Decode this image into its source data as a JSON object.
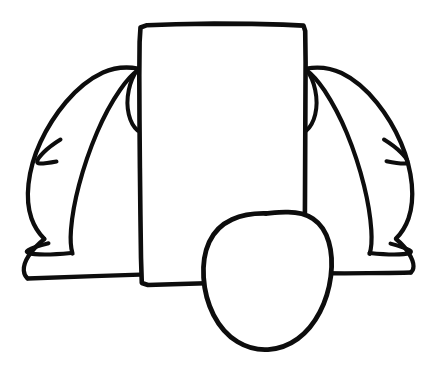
{
  "image": {
    "kind": "hand-drawn-line-art",
    "title": "Hand-drawn line sketch",
    "description": "Black ink outline drawing of a figure: a large upright rectangle forming the body, long draped hair or cape shapes sweeping outward to the left and right with pointed tips, and a rounded oval head overlapping the lower center of the rectangle.",
    "canvas": {
      "width": 432,
      "height": 366
    },
    "colors": {
      "background": "#ffffff",
      "ink": "#0d0d0d"
    },
    "stroke": {
      "width_main": 4.2,
      "width_thin": 3.4,
      "linecap": "round",
      "linejoin": "round"
    },
    "shapes": [
      {
        "name": "body-rectangle",
        "label": "Rectangle body",
        "bbox": [
          139,
          24,
          305,
          286
        ],
        "stroke_width": 4.6,
        "path": "M140.5,27.5 L147,25.2 L176,24.2 L214,23.6 L252,23.9 L283,24.6 L303.5,25.6 L305.2,31 L305.6,62 L305.4,104 L305.2,150 L305.0,196 L304.8,232 L304.6,256 L304.2,272 L302.5,279.5 L276,281 L240,282.2 L206,283.2 L172,284.2 L148,285.0 L141.8,283.0 L141.0,258 L140.4,214 L139.9,168 L139.5,120 L139.3,76 L139.6,42 Z"
      },
      {
        "name": "left-drape-outer",
        "label": "Left hair/cape outer contour",
        "stroke_width": 4.3,
        "path": "M138.0,68.5 C126,66.5 114,67.5 103,72.5 C90,78.5 77,89 66,102 C55.5,114.5 47,128 40.5,142 C34,156 30,170.5 28.5,184 C27.0,197.5 28.2,209 31.5,218.5 C34.5,227 39,233.5 44,238.5"
      },
      {
        "name": "left-drape-inner",
        "label": "Left hair/cape inner contour",
        "stroke_width": 4.2,
        "path": "M138.5,70.0 C133,73.5 126.5,80.5 120,90 C112,101.5 104,116 97,132.5 C89.5,150 83.5,168 79.0,185 C74.5,202 72.0,217 71.0,229.5 C70.2,240 70.8,248 72.5,253.5"
      },
      {
        "name": "left-drape-lower-flare",
        "label": "Left lower drape flare to baseline",
        "stroke_width": 4.2,
        "path": "M44.5,239.0 C38,244 32.5,250 28.5,256 C25.0,261.5 23.5,266.5 23.8,270.5 C24.1,274 25.4,276.6 27.5,278.3"
      },
      {
        "name": "left-inner-ear-curve",
        "label": "Left inner curl next to rectangle",
        "stroke_width": 4.0,
        "path": "M137.5,69.5 C133.5,75 130.5,82 128.8,90 C127.0,98.5 127.0,107 128.8,114.5 C130.5,121.5 133.6,127 137.6,130.6"
      },
      {
        "name": "left-fin-tip",
        "label": "Left pointed fin tip",
        "stroke_width": 4.0,
        "path": "M60.5,139.5 C54.0,143.5 48.0,148 43.5,152.5 C39.8,156.2 37.6,159.3 37.2,161.3 C36.9,162.9 37.9,163.6 40.0,163.6 C44.0,163.5 50.5,162.6 56.5,161.5"
      },
      {
        "name": "left-notch-tip",
        "label": "Left lower pointed notch",
        "stroke_width": 4.0,
        "path": "M71.0,253.0 C62.5,253.8 53.0,254.5 45.0,254.5 C37.5,254.5 31.5,254.0 28.5,253.0 C26.2,252.2 26.0,251.3 28.0,250.2 C31.5,248.2 39.5,245.6 48.5,243.3"
      },
      {
        "name": "left-baseline",
        "label": "Left baseline to rectangle",
        "stroke_width": 4.3,
        "path": "M27.5,278.5 C46,277.8 70,277.0 94,276.2 C116,275.5 131,275.0 140.2,274.7"
      },
      {
        "name": "right-drape-outer",
        "label": "Right hair/cape outer contour",
        "stroke_width": 4.3,
        "path": "M306.5,68.5 C318.5,66.5 330.5,67.8 341.5,73.0 C354,79 366.5,89.8 377,102.8 C387,115.2 395,128.8 401,142.8 C407,157 410.5,171 411.8,184.2 C413.0,197.5 411.8,209 408.5,218.5 C405.5,227 401,233.6 396,238.6"
      },
      {
        "name": "right-drape-inner",
        "label": "Right hair/cape inner contour",
        "stroke_width": 4.2,
        "path": "M306.0,70.0 C311.5,73.8 318.0,81 324.5,90.5 C332.0,102 340.0,116.5 346.8,133 C354.0,150.5 359.8,168.5 364.0,185.5 C368.2,202.5 370.5,217.5 371.3,230 C372.0,240.5 371.4,248.3 369.6,253.8"
      },
      {
        "name": "right-drape-lower-flare",
        "label": "Right lower drape flare to baseline",
        "stroke_width": 4.2,
        "path": "M396.0,239.0 C401.5,243.5 406.0,248.6 409.0,253.6 C412.0,258.5 413.5,262.8 413.5,266.2 C413.5,269.0 412.6,271.0 410.8,272.4"
      },
      {
        "name": "right-inner-ear-curve",
        "label": "Right inner curl next to rectangle",
        "stroke_width": 4.0,
        "path": "M306.5,69.5 C310.5,75 313.5,82 315.2,90 C317.0,98.5 317.0,107 315.2,114.5 C313.5,121.5 310.4,127 306.4,130.6"
      },
      {
        "name": "right-fin-tip",
        "label": "Right pointed fin tip",
        "stroke_width": 4.0,
        "path": "M384.0,139.5 C390.5,143.5 396.5,148 401.0,152.5 C404.8,156.2 407.0,159.3 407.4,161.3 C407.7,163.0 406.6,163.7 404.4,163.6 C400.0,163.5 393.0,162.5 386.5,161.2"
      },
      {
        "name": "right-notch-tip",
        "label": "Right lower pointed notch",
        "stroke_width": 4.0,
        "path": "M369.5,253.0 C377.5,253.8 386.5,254.5 394.0,254.5 C401.0,254.5 406.5,254.0 409.3,253.0 C411.5,252.2 411.6,251.3 409.6,250.2 C406.2,248.3 398.8,245.8 390.5,243.6"
      },
      {
        "name": "right-baseline",
        "label": "Right baseline from oval to flare tip",
        "stroke_width": 4.3,
        "path": "M305.0,273.2 C322,273.2 345,273.4 368,273.2 C388,273.0 402,272.8 410.8,272.5"
      },
      {
        "name": "head-oval",
        "label": "Rounded oval head",
        "stroke_width": 4.8,
        "path": "M266.0,213.5 C253.0,213.2 241.5,215.2 232.0,219.5 C221.5,224.3 213.8,232.0 209.2,242.0 C204.5,252.2 202.8,264.5 203.6,277.5 C204.4,290.5 207.8,303.5 213.5,314.8 C219.5,326.5 227.8,335.8 237.5,341.8 C247.0,347.6 257.5,350.2 268.0,349.6 C278.8,349.0 289.0,345.2 297.8,338.8 C306.8,332.2 314.2,323.0 319.8,312.2 C325.5,301.2 329.2,288.8 330.8,276.5 C332.4,264.0 331.8,252.2 328.8,242.0 C325.8,231.8 320.5,223.8 313.0,218.8 C305.5,213.8 296.0,211.8 285.5,212.2 C279.0,212.4 272.5,213.0 266.0,213.5 Z"
      }
    ]
  }
}
